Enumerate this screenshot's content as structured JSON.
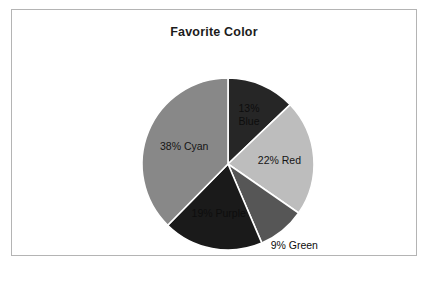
{
  "chart_data": {
    "type": "pie",
    "title": "Favorite Color",
    "categories": [
      "Blue",
      "Red",
      "Green",
      "Purple",
      "Cyan"
    ],
    "values": [
      13,
      22,
      9,
      19,
      38
    ],
    "labels": [
      "13%\nBlue",
      "22% Red",
      "9% Green",
      "19% Purple",
      "38% Cyan"
    ],
    "unit": "%",
    "start_angle_deg": 0,
    "direction": "clockwise",
    "legend": "none",
    "grid": false,
    "colors": [
      "#262626",
      "#bdbdbd",
      "#565656",
      "#1a1a1a",
      "#888888"
    ],
    "slice_border_color": "#ffffff",
    "label_positions": [
      "inside",
      "inside",
      "outside",
      "inside",
      "inside"
    ]
  },
  "frame": {
    "border_color": "#b4b4b4",
    "background": "#ffffff"
  }
}
